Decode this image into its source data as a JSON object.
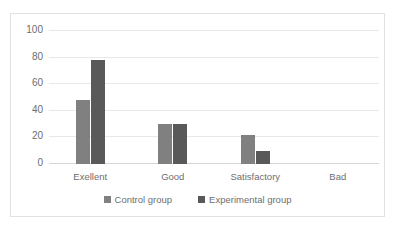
{
  "chart_data": {
    "type": "bar",
    "title": "",
    "subtitle": "",
    "xlabel": "",
    "ylabel": "",
    "categories": [
      "Exellent",
      "Good",
      "Satisfactory",
      "Bad"
    ],
    "series": [
      {
        "name": "Control group",
        "color": "#808080",
        "values": [
          48,
          30,
          22,
          0
        ]
      },
      {
        "name": "Experimental group",
        "color": "#595959",
        "values": [
          78,
          30,
          10,
          0
        ]
      }
    ],
    "ylim": [
      0,
      100
    ],
    "yticks": [
      0,
      20,
      40,
      60,
      80,
      100
    ],
    "ytick_labels": [
      "0",
      "20",
      "40",
      "60",
      "80",
      "100"
    ],
    "grid": true,
    "grid_axis": "y",
    "legend_position": "bottom",
    "plot_background": "#ffffff",
    "gridline_color": "#e8e8e8",
    "border_color": "#e2e2e2",
    "axis_text_color": "#6e6e6e"
  }
}
